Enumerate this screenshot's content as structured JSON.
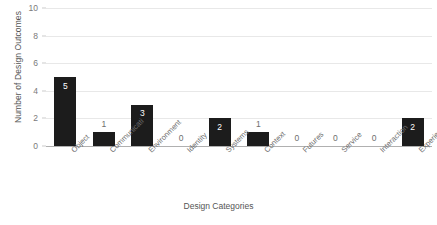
{
  "chart_data": {
    "type": "bar",
    "title": "",
    "xlabel": "Design Categories",
    "ylabel": "Number of Design Outcomes",
    "categories": [
      "Object",
      "Communicati",
      "Environment",
      "Identity",
      "Systems",
      "Context",
      "Futures",
      "Service",
      "Interaction",
      "Experience"
    ],
    "values": [
      5,
      1,
      3,
      0,
      2,
      1,
      0,
      0,
      0,
      2
    ],
    "value_labels": [
      "5",
      "1",
      "3",
      "0",
      "2",
      "1",
      "0",
      "0",
      "0",
      "2"
    ],
    "ylim": [
      0,
      10
    ],
    "yticks": [
      0,
      2,
      4,
      6,
      8,
      10
    ],
    "ytick_labels": [
      "0",
      "2",
      "4",
      "6",
      "8",
      "10"
    ],
    "grid": true,
    "legend": false,
    "bar_color": "#1c1c1c",
    "gridline_color": "#e8e8e8",
    "axis_color": "#b0b0b0",
    "label_inside_color": "#ffffff",
    "label_outside_color": "#6e6e6e",
    "tick_text_color": "#7a7a7a",
    "axis_title_color": "#555555",
    "background": "#ffffff"
  }
}
